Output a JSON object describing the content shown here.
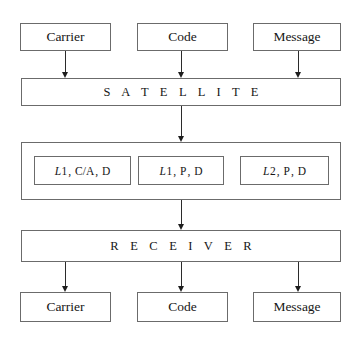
{
  "diagram": {
    "colors": {
      "border": "#6b6b6b",
      "arrow": "#1d1d1d",
      "text": "#161616",
      "background": "#ffffff"
    },
    "source_inputs": [
      {
        "label": "Carrier",
        "name": "carrier"
      },
      {
        "label": "Code",
        "name": "code"
      },
      {
        "label": "Message",
        "name": "message"
      }
    ],
    "satellite_stage": {
      "label": "S A T E L L I T E",
      "plain": "SATELLITE"
    },
    "signals": [
      {
        "band": "L",
        "band_index": "1",
        "code": "C/A",
        "data": "D",
        "text": "L1 , C/A , D"
      },
      {
        "band": "L",
        "band_index": "1",
        "code": "P",
        "data": "D",
        "text": "L1 , P , D"
      },
      {
        "band": "L",
        "band_index": "2",
        "code": "P",
        "data": "D",
        "text": "L2 , P , D"
      }
    ],
    "receiver_stage": {
      "label": "R E C E I V E R",
      "plain": "RECEIVER"
    },
    "output_results": [
      {
        "label": "Carrier",
        "name": "carrier"
      },
      {
        "label": "Code",
        "name": "code"
      },
      {
        "label": "Message",
        "name": "message"
      }
    ],
    "separator": ","
  }
}
